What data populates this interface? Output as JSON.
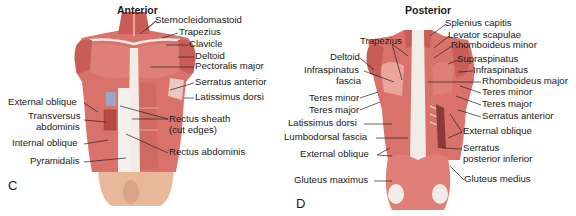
{
  "panels": [
    {
      "letter": "C",
      "title": "Anterior",
      "labels": {
        "sternocleidomastoid": "Sternocleidomastoid",
        "trapezius": "Trapezius",
        "clavicle": "Clavicle",
        "deltoid": "Deltoid",
        "pectoralis_major": "Pectoralis major",
        "serratus_anterior": "Serratus anterior",
        "latissimus_dorsi": "Latissimus dorsi",
        "external_oblique": "External oblique",
        "transversus_abdominis_1": "Transversus",
        "transversus_abdominis_2": "abdominis",
        "rectus_sheath_1": "Rectus sheath",
        "rectus_sheath_2": "(cut edges)",
        "internal_oblique": "Internal oblique",
        "rectus_abdominis": "Rectus abdominis",
        "pyramidalis": "Pyramidalis"
      }
    },
    {
      "letter": "D",
      "title": "Posterior",
      "labels": {
        "splenius_capitis": "Splenius capitis",
        "levator_scapulae": "Levator scapulae",
        "rhomboideus_minor": "Rhomboideus minor",
        "trapezius": "Trapezius",
        "supraspinatus": "Supraspinatus",
        "deltoid": "Deltoid",
        "infraspinatus_fascia_1": "Infraspinatus",
        "infraspinatus_fascia_2": "fascia",
        "infraspinatus": "Infraspinatus",
        "rhomboideus_major": "Rhomboideus major",
        "teres_minor_left": "Teres minor",
        "teres_minor_right": "Teres minor",
        "teres_major_left": "Teres major",
        "teres_major_right": "Teres major",
        "serratus_anterior": "Serratus anterior",
        "latissimus_dorsi": "Latissimus dorsi",
        "external_oblique_right": "External oblique",
        "lumbodorsal_fascia": "Lumbodorsal fascia",
        "serratus_posterior_inferior_1": "Serratus",
        "serratus_posterior_inferior_2": "posterior inferior",
        "external_oblique_left": "External oblique",
        "gluteus_maximus": "Gluteus maximus",
        "gluteus_medius": "Gluteus medius"
      }
    }
  ],
  "colors": {
    "muscle": "#d9726a",
    "muscle_dark": "#b84a45",
    "muscle_light": "#eaa59c",
    "fascia": "#f2ece8",
    "skin": "#e8b89a",
    "leader_line": "#222222"
  }
}
